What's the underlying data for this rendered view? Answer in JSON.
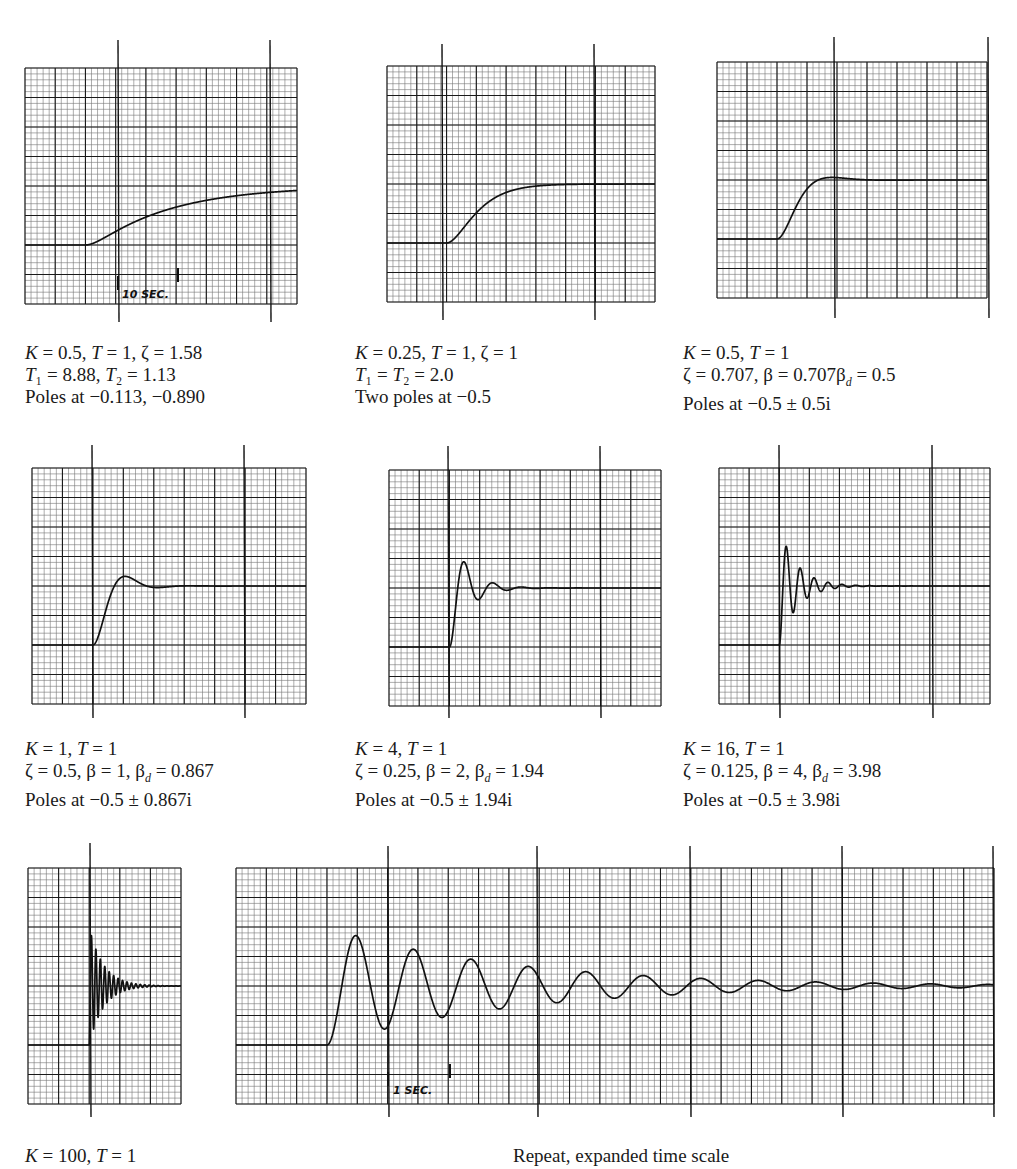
{
  "figure": {
    "panels": [
      {
        "id": "p1",
        "caption": [
          "K = 0.5, T = 1, ζ = 1.58",
          "T₁ = 8.88, T₂ = 1.13",
          "Poles at −0.113, −0.890"
        ],
        "time_marker": "10 SEC."
      },
      {
        "id": "p2",
        "caption": [
          "K = 0.25, T = 1, ζ = 1",
          "T₁ = T₂ = 2.0",
          "Two poles at −0.5"
        ]
      },
      {
        "id": "p3",
        "caption": [
          "K = 0.5, T = 1",
          "ζ = 0.707, β = 0.707β_d = 0.5",
          "Poles at −0.5 ± 0.5i"
        ]
      },
      {
        "id": "p4",
        "caption": [
          "K = 1, T = 1",
          "ζ = 0.5, β = 1, β_d = 0.867",
          "Poles at −0.5 ± 0.867i"
        ]
      },
      {
        "id": "p5",
        "caption": [
          "K = 4, T = 1",
          "ζ = 0.25, β = 2, β_d = 1.94",
          "Poles at −0.5 ± 1.94i"
        ]
      },
      {
        "id": "p6",
        "caption": [
          "K = 16, T = 1",
          "ζ = 0.125, β = 4, β_d = 3.98",
          "Poles at −0.5 ± 3.98i"
        ]
      },
      {
        "id": "p7",
        "caption": [
          "K = 100, T = 1"
        ]
      },
      {
        "id": "p8",
        "caption": [
          "Repeat, expanded time scale"
        ],
        "time_marker": "1 SEC."
      }
    ]
  },
  "chart_data": [
    {
      "type": "line",
      "title": "K = 0.5, T = 1, ζ = 1.58",
      "response": "overdamped",
      "zeta": 1.58,
      "poles": [
        -0.113,
        -0.89
      ],
      "T1": 8.88,
      "T2": 1.13,
      "initial_level": 0,
      "final_level": 1,
      "time_scale_label": "10 SEC.",
      "grid": true
    },
    {
      "type": "line",
      "title": "K = 0.25, T = 1, ζ = 1",
      "response": "critically damped",
      "zeta": 1,
      "poles": [
        -0.5,
        -0.5
      ],
      "T1": 2.0,
      "T2": 2.0,
      "initial_level": 0,
      "final_level": 1,
      "grid": true
    },
    {
      "type": "line",
      "title": "K = 0.5, T = 1",
      "response": "underdamped",
      "zeta": 0.707,
      "beta": 0.5,
      "beta_d": 0.5,
      "poles": [
        "-0.5+0.5i",
        "-0.5-0.5i"
      ],
      "overshoot_pct": 4,
      "grid": true
    },
    {
      "type": "line",
      "title": "K = 1, T = 1",
      "response": "underdamped",
      "zeta": 0.5,
      "beta": 1,
      "beta_d": 0.867,
      "poles": [
        "-0.5+0.867i",
        "-0.5-0.867i"
      ],
      "overshoot_pct": 16,
      "grid": true
    },
    {
      "type": "line",
      "title": "K = 4, T = 1",
      "response": "underdamped",
      "zeta": 0.25,
      "beta": 2,
      "beta_d": 1.94,
      "poles": [
        "-0.5+1.94i",
        "-0.5-1.94i"
      ],
      "overshoot_pct": 44,
      "grid": true
    },
    {
      "type": "line",
      "title": "K = 16, T = 1",
      "response": "underdamped",
      "zeta": 0.125,
      "beta": 4,
      "beta_d": 3.98,
      "poles": [
        "-0.5+3.98i",
        "-0.5-3.98i"
      ],
      "overshoot_pct": 67,
      "grid": true
    },
    {
      "type": "line",
      "title": "K = 100, T = 1",
      "response": "underdamped",
      "zeta": 0.05,
      "beta": 10,
      "beta_d": 9.99,
      "overshoot_pct": 85,
      "grid": true
    },
    {
      "type": "line",
      "title": "Repeat, expanded time scale",
      "response": "underdamped",
      "zeta": 0.05,
      "beta": 10,
      "time_scale_label": "1 SEC.",
      "grid": true
    }
  ],
  "chart_layout": [
    {
      "x": 25,
      "y": 68,
      "w": 272,
      "h": 236,
      "cols": 9,
      "rows": 8,
      "base_row": 2,
      "final_row": 4,
      "step_col": 2,
      "t_end": 24,
      "tmark": [
        118,
        270
      ],
      "tmark_top": 40,
      "tmark_bot": 322
    },
    {
      "x": 387,
      "y": 66,
      "w": 268,
      "h": 236,
      "cols": 9,
      "rows": 8,
      "base_row": 2,
      "final_row": 4,
      "step_col": 2,
      "t_end": 24,
      "tmark": [
        442,
        594
      ],
      "tmark_top": 44,
      "tmark_bot": 320
    },
    {
      "x": 717,
      "y": 62,
      "w": 270,
      "h": 236,
      "cols": 9,
      "rows": 8,
      "base_row": 2,
      "final_row": 4,
      "step_col": 2,
      "t_end": 24,
      "tmark": [
        834,
        988
      ],
      "tmark_top": 37,
      "tmark_bot": 318
    },
    {
      "x": 32,
      "y": 468,
      "w": 274,
      "h": 236,
      "cols": 9,
      "rows": 8,
      "base_row": 2,
      "final_row": 4,
      "step_col": 2,
      "t_end": 24,
      "tmark": [
        92,
        244
      ],
      "tmark_top": 445,
      "tmark_bot": 718
    },
    {
      "x": 389,
      "y": 470,
      "w": 272,
      "h": 236,
      "cols": 9,
      "rows": 8,
      "base_row": 2,
      "final_row": 4,
      "step_col": 2,
      "t_end": 24,
      "tmark": [
        448,
        600
      ],
      "tmark_top": 446,
      "tmark_bot": 718
    },
    {
      "x": 719,
      "y": 468,
      "w": 271,
      "h": 236,
      "cols": 9,
      "rows": 8,
      "base_row": 2,
      "final_row": 4,
      "step_col": 2,
      "t_end": 24,
      "tmark": [
        779,
        932
      ],
      "tmark_top": 445,
      "tmark_bot": 718
    },
    {
      "x": 28,
      "y": 868,
      "w": 153,
      "h": 236,
      "cols": 5,
      "rows": 8,
      "base_row": 2,
      "final_row": 4,
      "step_col": 2,
      "t_end": 13,
      "tmark": [
        90
      ],
      "tmark_top": 843,
      "tmark_bot": 1117
    },
    {
      "x": 236,
      "y": 868,
      "w": 758,
      "h": 236,
      "cols": 25,
      "rows": 8,
      "base_row": 2,
      "final_row": 4,
      "step_col": 3,
      "t_end": 7.3,
      "tmark": [
        388,
        537,
        690,
        842,
        993
      ],
      "tmark_top": 846,
      "tmark_bot": 1117
    }
  ],
  "caption_layout": [
    {
      "x": 25,
      "y": 342
    },
    {
      "x": 355,
      "y": 342
    },
    {
      "x": 683,
      "y": 342
    },
    {
      "x": 25,
      "y": 738
    },
    {
      "x": 355,
      "y": 738
    },
    {
      "x": 683,
      "y": 738
    },
    {
      "x": 25,
      "y": 1145
    },
    {
      "x": 513,
      "y": 1145
    }
  ],
  "colors": {
    "grid_major": "#1a1a1a",
    "grid_minor": "#4a4a4a",
    "curve": "#111111",
    "paper": "#ffffff"
  }
}
